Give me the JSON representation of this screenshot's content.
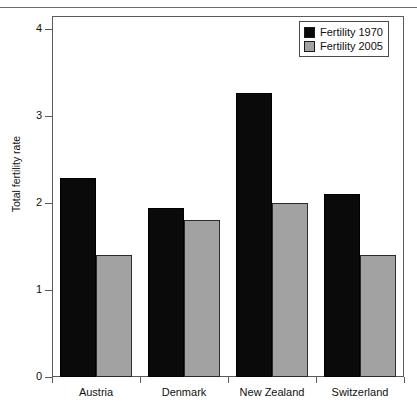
{
  "chart_data": {
    "type": "bar",
    "title": "",
    "xlabel": "",
    "ylabel": "Total fertility rate",
    "ylim": [
      0,
      4.15
    ],
    "yticks": [
      0,
      1,
      2,
      3,
      4
    ],
    "ytick_labels": [
      "0",
      "1",
      "2",
      "3",
      "4"
    ],
    "grid": false,
    "legend_position": "top-right",
    "categories": [
      "Austria",
      "Denmark",
      "New Zealand",
      "Switzerland"
    ],
    "series": [
      {
        "name": "Fertility 1970",
        "color": "#0a0a0a",
        "values": [
          2.29,
          1.94,
          3.27,
          2.1
        ]
      },
      {
        "name": "Fertility 2005",
        "color": "#a2a2a2",
        "values": [
          1.4,
          1.8,
          2.0,
          1.4
        ]
      }
    ]
  },
  "legend": {
    "items": [
      {
        "label": "Fertility 1970",
        "swatch": "black-square"
      },
      {
        "label": "Fertility 2005",
        "swatch": "grey-square"
      }
    ]
  },
  "axes": {
    "y_title": "Total fertility rate",
    "y_tick_labels": [
      "4",
      "3",
      "2",
      "1",
      "0"
    ],
    "x_tick_labels": [
      "Austria",
      "Denmark",
      "New Zealand",
      "Switzerland"
    ]
  }
}
